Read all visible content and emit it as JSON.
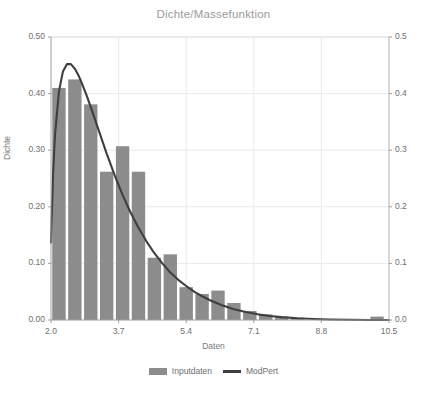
{
  "chart_data": {
    "type": "bar",
    "title": "Dichte/Massefunktion",
    "xlabel": "Daten",
    "ylabel": "Dichte",
    "grid": true,
    "legend_position": "bottom",
    "xlim": [
      2.0,
      10.5
    ],
    "ylim": [
      0.0,
      0.5
    ],
    "xticks": [
      "2.0",
      "3.7",
      "5.4",
      "7.1",
      "8.8",
      "10.5"
    ],
    "xtick_values": [
      2.0,
      3.7,
      5.4,
      7.1,
      8.8,
      10.5
    ],
    "yticks_left": [
      "0.00",
      "0.10",
      "0.20",
      "0.30",
      "0.40",
      "0.50"
    ],
    "ytick_values_left": [
      0.0,
      0.1,
      0.2,
      0.3,
      0.4,
      0.5
    ],
    "yticks_right": [
      "0.0",
      "0.1",
      "0.2",
      "0.3",
      "0.4",
      "0.5"
    ],
    "ytick_values_right": [
      0.0,
      0.1,
      0.2,
      0.3,
      0.4,
      0.5
    ],
    "ylim_right": [
      0.0,
      0.5
    ],
    "series": [
      {
        "name": "Inputdaten",
        "type": "bar",
        "color": "#8c8c8c",
        "bin_width": 0.4,
        "bin_starts": [
          2.0,
          2.4,
          2.8,
          3.2,
          3.6,
          4.0,
          4.4,
          4.8,
          5.2,
          5.6,
          6.0,
          6.4,
          6.8,
          7.2,
          7.6,
          8.0,
          10.0
        ],
        "values": [
          0.41,
          0.425,
          0.381,
          0.262,
          0.307,
          0.262,
          0.11,
          0.116,
          0.058,
          0.046,
          0.052,
          0.03,
          0.016,
          0.01,
          0.006,
          0.004,
          0.006
        ]
      },
      {
        "name": "ModPert",
        "type": "line",
        "color": "#3f3f3f",
        "x": [
          2.0,
          2.05,
          2.1,
          2.2,
          2.3,
          2.4,
          2.5,
          2.6,
          2.7,
          2.8,
          2.9,
          3.0,
          3.2,
          3.4,
          3.6,
          3.8,
          4.0,
          4.2,
          4.4,
          4.6,
          4.8,
          5.0,
          5.2,
          5.4,
          5.6,
          5.8,
          6.0,
          6.3,
          6.6,
          6.9,
          7.2,
          7.5,
          7.8,
          8.2,
          8.6,
          9.0,
          9.5,
          10.0,
          10.5
        ],
        "y": [
          0.137,
          0.255,
          0.327,
          0.404,
          0.439,
          0.452,
          0.452,
          0.444,
          0.431,
          0.414,
          0.396,
          0.376,
          0.335,
          0.294,
          0.256,
          0.221,
          0.19,
          0.163,
          0.139,
          0.118,
          0.1,
          0.084,
          0.071,
          0.06,
          0.05,
          0.042,
          0.035,
          0.026,
          0.019,
          0.014,
          0.01,
          0.0072,
          0.0051,
          0.0031,
          0.0018,
          0.001,
          0.0004,
          0.0001,
          0.0
        ]
      }
    ]
  },
  "legend": {
    "items": [
      {
        "label": "Inputdaten",
        "marker": "bar-swatch"
      },
      {
        "label": "ModPert",
        "marker": "line-swatch"
      }
    ]
  }
}
